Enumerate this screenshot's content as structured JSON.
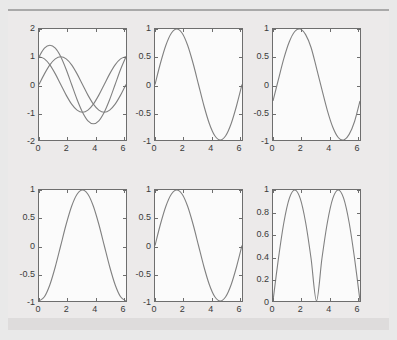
{
  "figure": {
    "background_color": "#eceaea",
    "axes_background_color": "#fbfbfb",
    "axes_edge_color": "#6e6e6e",
    "curve_color": "#808080",
    "rows": 2,
    "cols": 3
  },
  "chart_data": [
    {
      "id": "subplot-1",
      "type": "line",
      "title": "",
      "xlabel": "",
      "ylabel": "",
      "xlim": [
        0,
        6.2832
      ],
      "ylim": [
        -2,
        2
      ],
      "xticks": [
        0,
        2,
        4,
        6
      ],
      "yticks": [
        -2,
        -1,
        0,
        1,
        2
      ],
      "xticklabels": [
        "0",
        "2",
        "4",
        "6"
      ],
      "yticklabels": [
        "-2",
        "-1",
        "0",
        "1",
        "2"
      ],
      "grid": false,
      "legend": "none",
      "series": [
        {
          "name": "sin(x)",
          "x": [
            0,
            0.3927,
            0.7854,
            1.1781,
            1.5708,
            1.9635,
            2.3562,
            2.7489,
            3.1416,
            3.5343,
            3.927,
            4.3197,
            4.7124,
            5.1051,
            5.4978,
            5.8905,
            6.2832
          ],
          "values": [
            0,
            0.3827,
            0.7071,
            0.9239,
            1,
            0.9239,
            0.7071,
            0.3827,
            0,
            -0.3827,
            -0.7071,
            -0.9239,
            -1,
            -0.9239,
            -0.7071,
            -0.3827,
            0
          ]
        },
        {
          "name": "cos(x)",
          "x": [
            0,
            0.3927,
            0.7854,
            1.1781,
            1.5708,
            1.9635,
            2.3562,
            2.7489,
            3.1416,
            3.5343,
            3.927,
            4.3197,
            4.7124,
            5.1051,
            5.4978,
            5.8905,
            6.2832
          ],
          "values": [
            1,
            0.9239,
            0.7071,
            0.3827,
            0,
            -0.3827,
            -0.7071,
            -0.9239,
            -1,
            -0.9239,
            -0.7071,
            -0.3827,
            0,
            0.3827,
            0.7071,
            0.9239,
            1
          ]
        },
        {
          "name": "sin(x)+cos(x)",
          "x": [
            0,
            0.3927,
            0.7854,
            1.1781,
            1.5708,
            1.9635,
            2.3562,
            2.7489,
            3.1416,
            3.5343,
            3.927,
            4.3197,
            4.7124,
            5.1051,
            5.4978,
            5.8905,
            6.2832
          ],
          "values": [
            1,
            1.3066,
            1.4142,
            1.3066,
            1,
            0.5412,
            0,
            -0.5412,
            -1,
            -1.3066,
            -1.4142,
            -1.3066,
            -1,
            -0.5412,
            0,
            0.5412,
            1
          ]
        }
      ]
    },
    {
      "id": "subplot-2",
      "type": "line",
      "title": "",
      "xlabel": "",
      "ylabel": "",
      "xlim": [
        0,
        6.2832
      ],
      "ylim": [
        -1,
        1
      ],
      "xticks": [
        0,
        2,
        4,
        6
      ],
      "yticks": [
        -1,
        -0.5,
        0,
        0.5,
        1
      ],
      "xticklabels": [
        "0",
        "2",
        "4",
        "6"
      ],
      "yticklabels": [
        "-1",
        "-0.5",
        "0",
        "0.5",
        "1"
      ],
      "grid": false,
      "legend": "none",
      "series": [
        {
          "name": "sin(x)",
          "x": [
            0,
            0.3927,
            0.7854,
            1.1781,
            1.5708,
            1.9635,
            2.3562,
            2.7489,
            3.1416,
            3.5343,
            3.927,
            4.3197,
            4.7124,
            5.1051,
            5.4978,
            5.8905,
            6.2832
          ],
          "values": [
            0,
            0.3827,
            0.7071,
            0.9239,
            1,
            0.9239,
            0.7071,
            0.3827,
            0,
            -0.3827,
            -0.7071,
            -0.9239,
            -1,
            -0.9239,
            -0.7071,
            -0.3827,
            0
          ]
        }
      ]
    },
    {
      "id": "subplot-3",
      "type": "line",
      "title": "",
      "xlabel": "",
      "ylabel": "",
      "xlim": [
        0,
        6.2832
      ],
      "ylim": [
        -1,
        1
      ],
      "xticks": [
        0,
        2,
        4,
        6
      ],
      "yticks": [
        -1,
        -0.5,
        0,
        0.5,
        1
      ],
      "xticklabels": [
        "0",
        "2",
        "4",
        "6"
      ],
      "yticklabels": [
        "-1",
        "-0.5",
        "0",
        "0.5",
        "1"
      ],
      "grid": false,
      "legend": "none",
      "series": [
        {
          "name": "sin(x - 0.3)",
          "x": [
            0,
            0.3927,
            0.7854,
            1.1781,
            1.5708,
            1.9635,
            2.3562,
            2.7489,
            3.1416,
            3.5343,
            3.927,
            4.3197,
            4.7124,
            5.1051,
            5.4978,
            5.8905,
            6.2832
          ],
          "values": [
            -0.2955,
            0.0927,
            0.4706,
            0.7702,
            0.9553,
            0.9989,
            0.8987,
            0.6663,
            0.2955,
            -0.0927,
            -0.4706,
            -0.7702,
            -0.9553,
            -0.9989,
            -0.8987,
            -0.6663,
            -0.2955
          ]
        }
      ]
    },
    {
      "id": "subplot-4",
      "type": "line",
      "title": "",
      "xlabel": "",
      "ylabel": "",
      "xlim": [
        0,
        6.2832
      ],
      "ylim": [
        -1,
        1
      ],
      "xticks": [
        0,
        2,
        4,
        6
      ],
      "yticks": [
        -1,
        -0.5,
        0,
        0.5,
        1
      ],
      "xticklabels": [
        "0",
        "2",
        "4",
        "6"
      ],
      "yticklabels": [
        "-1",
        "-0.5",
        "0",
        "0.5",
        "1"
      ],
      "grid": false,
      "legend": "none",
      "series": [
        {
          "name": "-cos(x)",
          "x": [
            0,
            0.3927,
            0.7854,
            1.1781,
            1.5708,
            1.9635,
            2.3562,
            2.7489,
            3.1416,
            3.5343,
            3.927,
            4.3197,
            4.7124,
            5.1051,
            5.4978,
            5.8905,
            6.2832
          ],
          "values": [
            -1,
            -0.9239,
            -0.7071,
            -0.3827,
            0,
            0.3827,
            0.7071,
            0.9239,
            1,
            0.9239,
            0.7071,
            0.3827,
            0,
            -0.3827,
            -0.7071,
            -0.9239,
            -1
          ]
        }
      ]
    },
    {
      "id": "subplot-5",
      "type": "line",
      "title": "",
      "xlabel": "",
      "ylabel": "",
      "xlim": [
        0,
        6.2832
      ],
      "ylim": [
        -1,
        1
      ],
      "xticks": [
        0,
        2,
        4,
        6
      ],
      "yticks": [
        -1,
        -0.5,
        0,
        0.5,
        1
      ],
      "xticklabels": [
        "0",
        "2",
        "4",
        "6"
      ],
      "yticklabels": [
        "-1",
        "-0.5",
        "0",
        "0.5",
        "1"
      ],
      "grid": false,
      "legend": "none",
      "series": [
        {
          "name": "sin(x)",
          "x": [
            0,
            0.3927,
            0.7854,
            1.1781,
            1.5708,
            1.9635,
            2.3562,
            2.7489,
            3.1416,
            3.5343,
            3.927,
            4.3197,
            4.7124,
            5.1051,
            5.4978,
            5.8905,
            6.2832
          ],
          "values": [
            0,
            0.3827,
            0.7071,
            0.9239,
            1,
            0.9239,
            0.7071,
            0.3827,
            0,
            -0.3827,
            -0.7071,
            -0.9239,
            -1,
            -0.9239,
            -0.7071,
            -0.3827,
            0
          ]
        }
      ]
    },
    {
      "id": "subplot-6",
      "type": "line",
      "title": "",
      "xlabel": "",
      "ylabel": "",
      "xlim": [
        0,
        6.2832
      ],
      "ylim": [
        0,
        1
      ],
      "xticks": [
        0,
        2,
        4,
        6
      ],
      "yticks": [
        0,
        0.2,
        0.4,
        0.6,
        0.8,
        1
      ],
      "xticklabels": [
        "0",
        "2",
        "4",
        "6"
      ],
      "yticklabels": [
        "0",
        "0.2",
        "0.4",
        "0.6",
        "0.8",
        "1"
      ],
      "grid": false,
      "legend": "none",
      "series": [
        {
          "name": "abs(sin(x))",
          "x": [
            0,
            0.3927,
            0.7854,
            1.1781,
            1.5708,
            1.9635,
            2.3562,
            2.7489,
            3.1416,
            3.5343,
            3.927,
            4.3197,
            4.7124,
            5.1051,
            5.4978,
            5.8905,
            6.2832
          ],
          "values": [
            0,
            0.3827,
            0.7071,
            0.9239,
            1,
            0.9239,
            0.7071,
            0.3827,
            0,
            0.3827,
            0.7071,
            0.9239,
            1,
            0.9239,
            0.7071,
            0.3827,
            0
          ]
        }
      ]
    }
  ]
}
